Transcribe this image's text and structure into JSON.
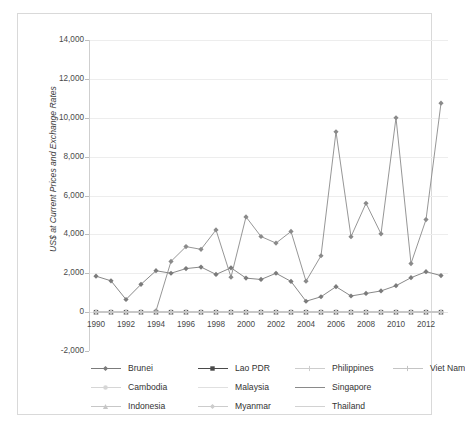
{
  "chart_data": {
    "type": "line",
    "title": "",
    "xlabel": "",
    "ylabel": "US$ at Current Prices and Exchange Rates",
    "ylim": [
      -2000,
      14000
    ],
    "ytick_values": [
      -2000,
      0,
      2000,
      4000,
      6000,
      8000,
      10000,
      12000,
      14000
    ],
    "ytick_labels": [
      "-2,000",
      "0",
      "2,000",
      "4,000",
      "6,000",
      "8,000",
      "10,000",
      "12,000",
      "14,000"
    ],
    "grid": true,
    "legend_position": "bottom",
    "x": [
      1990,
      1991,
      1992,
      1993,
      1994,
      1995,
      1996,
      1997,
      1998,
      1999,
      2000,
      2001,
      2002,
      2003,
      2004,
      2005,
      2006,
      2007,
      2008,
      2009,
      2010,
      2011,
      2012,
      2013
    ],
    "xtick_labels": [
      "1990",
      "1992",
      "1994",
      "1996",
      "1998",
      "2000",
      "2002",
      "2004",
      "2006",
      "2008",
      "2010",
      "2012"
    ],
    "xtick_values": [
      1990,
      1992,
      1994,
      1996,
      1998,
      2000,
      2002,
      2004,
      2006,
      2008,
      2010,
      2012
    ],
    "series": [
      {
        "name": "Brunei",
        "color": "#7b7b7b",
        "marker": "diamond",
        "values": [
          1850,
          1610,
          650,
          1430,
          2130,
          2000,
          2240,
          2320,
          1940,
          2280,
          1750,
          1680,
          2000,
          1580,
          560,
          790,
          1310,
          830,
          960,
          1090,
          1360,
          1770,
          2080,
          1880
        ]
      },
      {
        "name": "Cambodia",
        "color": "#d6d6d6",
        "marker": "circle",
        "values": [
          0,
          0,
          0,
          0,
          0,
          0,
          0,
          0,
          0,
          0,
          0,
          0,
          0,
          0,
          0,
          0,
          0,
          0,
          0,
          0,
          0,
          0,
          0,
          0
        ]
      },
      {
        "name": "Indonesia",
        "color": "#c7c7c7",
        "marker": "triangle",
        "values": [
          0,
          0,
          0,
          0,
          0,
          0,
          0,
          0,
          0,
          0,
          0,
          0,
          0,
          0,
          0,
          0,
          0,
          0,
          0,
          0,
          0,
          0,
          0,
          0
        ]
      },
      {
        "name": "Lao PDR",
        "color": "#4a4a4a",
        "marker": "square",
        "values": [
          0,
          0,
          0,
          0,
          0,
          0,
          0,
          0,
          0,
          0,
          0,
          0,
          0,
          0,
          0,
          0,
          0,
          0,
          0,
          0,
          0,
          0,
          0,
          0
        ]
      },
      {
        "name": "Malaysia",
        "color": "#e0e0e0",
        "marker": "none",
        "values": [
          0,
          0,
          0,
          0,
          0,
          0,
          0,
          0,
          0,
          0,
          0,
          0,
          0,
          0,
          0,
          0,
          0,
          0,
          0,
          0,
          0,
          0,
          0,
          0
        ]
      },
      {
        "name": "Myanmar",
        "color": "#cccccc",
        "marker": "diamond",
        "values": [
          0,
          0,
          0,
          0,
          0,
          0,
          0,
          0,
          0,
          0,
          0,
          0,
          0,
          0,
          0,
          0,
          0,
          0,
          0,
          0,
          0,
          0,
          0,
          0
        ]
      },
      {
        "name": "Philippines",
        "color": "#cdcdcd",
        "marker": "plus",
        "values": [
          0,
          0,
          0,
          0,
          0,
          0,
          0,
          0,
          0,
          0,
          0,
          0,
          0,
          0,
          0,
          0,
          0,
          0,
          0,
          0,
          0,
          0,
          0,
          0
        ]
      },
      {
        "name": "Singapore",
        "color": "#8a8a8a",
        "marker": "diamond",
        "values": [
          null,
          null,
          null,
          null,
          60,
          2610,
          3370,
          3230,
          4230,
          1800,
          4900,
          3890,
          3550,
          4150,
          1590,
          2900,
          9280,
          3880,
          5600,
          4030,
          10000,
          2500,
          4760,
          10750
        ]
      },
      {
        "name": "Thailand",
        "color": "#d2d2d2",
        "marker": "none",
        "values": [
          0,
          0,
          0,
          0,
          0,
          0,
          0,
          0,
          0,
          0,
          0,
          0,
          0,
          0,
          0,
          0,
          0,
          0,
          0,
          0,
          0,
          0,
          0,
          0
        ]
      },
      {
        "name": "Viet Nam",
        "color": "#c4c4c4",
        "marker": "plus",
        "values": [
          0,
          0,
          0,
          0,
          0,
          0,
          0,
          0,
          0,
          0,
          0,
          0,
          0,
          0,
          0,
          0,
          0,
          0,
          0,
          0,
          0,
          0,
          0,
          0
        ]
      }
    ]
  },
  "legend": {
    "rows": [
      [
        {
          "label": "Brunei",
          "color": "#7b7b7b",
          "marker": "diamond"
        },
        {
          "label": "Lao PDR",
          "color": "#4a4a4a",
          "marker": "square"
        },
        {
          "label": "Philippines",
          "color": "#cdcdcd",
          "marker": "plus"
        },
        {
          "label": "Viet Nam",
          "color": "#c4c4c4",
          "marker": "plus"
        }
      ],
      [
        {
          "label": "Cambodia",
          "color": "#d6d6d6",
          "marker": "circle"
        },
        {
          "label": "Malaysia",
          "color": "#e0e0e0",
          "marker": "none"
        },
        {
          "label": "Singapore",
          "color": "#8a8a8a",
          "marker": "none"
        }
      ],
      [
        {
          "label": "Indonesia",
          "color": "#c7c7c7",
          "marker": "triangle"
        },
        {
          "label": "Myanmar",
          "color": "#cccccc",
          "marker": "diamond"
        },
        {
          "label": "Thailand",
          "color": "#d2d2d2",
          "marker": "none"
        }
      ]
    ]
  }
}
